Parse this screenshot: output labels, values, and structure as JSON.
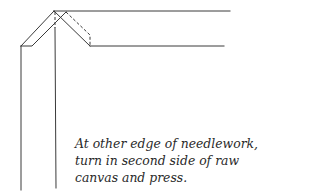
{
  "figure": {
    "line_color": "#3a3a3a",
    "caption_lines": [
      "At other edge of needlework,",
      "turn in second side of raw",
      "canvas and press."
    ]
  }
}
